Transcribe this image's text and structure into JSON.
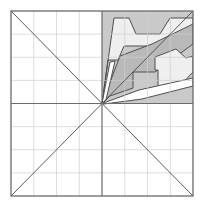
{
  "figure": {
    "caption": "",
    "background_color": "#ffffff"
  },
  "canvas": {
    "width": 204,
    "height": 211
  },
  "frame": {
    "name": "outer-square-border",
    "x": 11,
    "y": 11,
    "width": 182,
    "height": 185,
    "stroke_color": "#6b6b6b",
    "stroke_width": 1.3
  },
  "grid": {
    "columns": 8,
    "rows": 8,
    "cell_width": 22.75,
    "cell_height": 23.125,
    "line_color": "#cfcfcf",
    "line_width": 0.7,
    "visible": true
  },
  "axes": {
    "center_x": 102,
    "center_y": 103.5,
    "color": "#6b6b6b",
    "line_width": 1.2,
    "horizontal_label": "horizontal-axis",
    "vertical_label": "vertical-axis"
  },
  "diagonals": {
    "color": "#4a4a4a",
    "line_width": 0.9,
    "main_label": "diagonal-top-left-to-bottom-right",
    "anti_label": "diagonal-bottom-left-to-top-right"
  },
  "palette": {
    "quadrant_fill": "#c9c9c9",
    "mid_gray": "#b9b9b9",
    "light_gray": "#e2e2e2",
    "pale_gray": "#efefef",
    "white": "#ffffff",
    "outline": "#4f4f4f",
    "grid": "#cfcfcf",
    "frame": "#6b6b6b"
  },
  "shaded_quadrant": {
    "name": "upper-right-quadrant-shading",
    "x": 102,
    "y": 11,
    "width": 91,
    "height": 92.5,
    "fill": "#c9c9c9"
  },
  "chart_data": {
    "type": "scatter",
    "xlabel": "",
    "ylabel": "",
    "xlim": [
      -4,
      4
    ],
    "ylim": [
      -4,
      4
    ],
    "grid": true,
    "legend": "none",
    "series": [
      {
        "name": "band-outer-upper",
        "fill": "#efefef",
        "stroke": "#4f4f4f",
        "points": [
          [
            102,
            103.5
          ],
          [
            114,
            18
          ],
          [
            129,
            18
          ],
          [
            136,
            34
          ],
          [
            160,
            34
          ],
          [
            170,
            18
          ],
          [
            193,
            18
          ],
          [
            193,
            31
          ],
          [
            150,
            46
          ],
          [
            124,
            46
          ],
          [
            118,
            60
          ],
          [
            108,
            60
          ]
        ]
      },
      {
        "name": "band-middle",
        "fill": "#b9b9b9",
        "stroke": "#4f4f4f",
        "points": [
          [
            102,
            103.5
          ],
          [
            120,
            56
          ],
          [
            152,
            44
          ],
          [
            193,
            24
          ],
          [
            193,
            44
          ],
          [
            155,
            72
          ],
          [
            133,
            72
          ],
          [
            133,
            88
          ],
          [
            110,
            96
          ]
        ]
      },
      {
        "name": "band-stepped-inner",
        "fill": "#efefef",
        "stroke": "#4f4f4f",
        "points": [
          [
            155,
            70
          ],
          [
            155,
            57
          ],
          [
            176,
            49
          ],
          [
            186,
            58
          ],
          [
            193,
            56
          ],
          [
            193,
            72
          ],
          [
            178,
            88
          ],
          [
            158,
            88
          ],
          [
            158,
            70
          ]
        ]
      },
      {
        "name": "band-lower-thin",
        "fill": "#ffffff",
        "stroke": "#4f4f4f",
        "points": [
          [
            102,
            103.5
          ],
          [
            139,
            90
          ],
          [
            193,
            78
          ],
          [
            193,
            86
          ],
          [
            142,
            99
          ],
          [
            104,
            104
          ]
        ]
      },
      {
        "name": "band-upper-thin-white",
        "fill": "#ffffff",
        "stroke": "#4f4f4f",
        "points": [
          [
            102,
            103.5
          ],
          [
            110,
            62
          ],
          [
            115,
            61
          ],
          [
            106,
            100
          ]
        ]
      }
    ],
    "annotations": [
      {
        "label": "center-origin",
        "x": 102,
        "y": 103.5
      }
    ]
  },
  "accessibility": {
    "alt_text": "A square divided by an eight-by-eight light grid with bold horizontal and vertical center axes and two full corner-to-corner diagonals. The upper-right quadrant is filled with gray and contains several nested angular bands of lighter and darker gray radiating outward from the center point."
  }
}
